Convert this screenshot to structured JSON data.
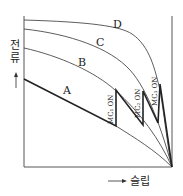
{
  "diagram": {
    "y_axis_label": [
      "전",
      "류"
    ],
    "x_axis_label": "슬립",
    "curves": [
      {
        "id": "A",
        "label": "A"
      },
      {
        "id": "B",
        "label": "B"
      },
      {
        "id": "C",
        "label": "C"
      },
      {
        "id": "D",
        "label": "D"
      }
    ],
    "switch_labels": [
      {
        "id": "mc1",
        "label": "MC₁ ON"
      },
      {
        "id": "mc2",
        "label": "MC₂ ON"
      },
      {
        "id": "mc3",
        "label": "MC₃ ON"
      }
    ]
  }
}
